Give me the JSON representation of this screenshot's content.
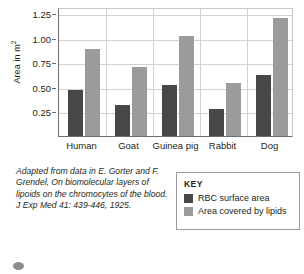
{
  "chart_data": {
    "type": "bar",
    "title": "",
    "xlabel": "",
    "ylabel": "Area in m",
    "ylabel_sup": "2",
    "categories": [
      "Human",
      "Goat",
      "Guinea pig",
      "Rabbit",
      "Dog"
    ],
    "series": [
      {
        "name": "RBC surface area",
        "color": "#474747",
        "values": [
          0.47,
          0.32,
          0.52,
          0.27,
          0.62
        ]
      },
      {
        "name": "Area covered by lipids",
        "color": "#9b9b9b",
        "values": [
          0.89,
          0.7,
          1.02,
          0.54,
          1.2
        ]
      }
    ],
    "ylim": [
      0,
      1.3125
    ],
    "yticks": [
      0.25,
      0.5,
      0.75,
      1.0,
      1.25
    ],
    "ytick_labels": [
      "0.25",
      "0.50",
      "0.75",
      "1.00",
      "1.25"
    ],
    "grid": "horizontal-and-vertical-separators",
    "legend_position": "below-right"
  },
  "key": {
    "title": "KEY",
    "entries": [
      {
        "label": "RBC surface area",
        "color": "#474747"
      },
      {
        "label": "Area covered by lipids",
        "color": "#9b9b9b"
      }
    ]
  },
  "caption": {
    "text": "Adapted from data in E. Gorter and F. Grendel, On biomolecular layers of lipoids on the chromocytes of the blood. J Exp Med 41: 439-446, 1925."
  },
  "colors": {
    "series_dark": "#474747",
    "series_light": "#9b9b9b",
    "axis": "#6e6e6e",
    "grid": "#d2d2d2",
    "text": "#231f20",
    "key_border": "#9a9a9a",
    "dot": "#8c8c8c"
  }
}
